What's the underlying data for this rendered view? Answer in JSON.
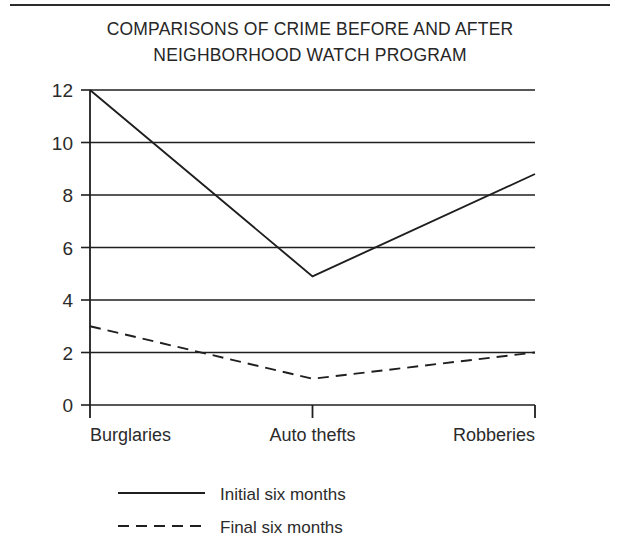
{
  "chart_data": {
    "type": "line",
    "title_line1": "COMPARISONS OF CRIME BEFORE AND AFTER",
    "title_line2": "NEIGHBORHOOD WATCH PROGRAM",
    "xlabel": "",
    "ylabel": "",
    "categories": [
      "Burglaries",
      "Auto thefts",
      "Robberies"
    ],
    "series": [
      {
        "name": "Initial six months",
        "style": "solid",
        "values": [
          12,
          4.9,
          8.8
        ]
      },
      {
        "name": "Final six months",
        "style": "dashed",
        "values": [
          3,
          1,
          2
        ]
      }
    ],
    "ylim": [
      0,
      12
    ],
    "yticks": [
      0,
      2,
      4,
      6,
      8,
      10,
      12
    ],
    "ytick_labels": [
      "0",
      "2",
      "4",
      "6",
      "8",
      "10",
      "12"
    ],
    "grid": true,
    "grid_axis": "y",
    "legend_position": "below",
    "line_color": "#1f1f1f",
    "grid_color": "#1f1f1f",
    "background": "#ffffff"
  },
  "legend": {
    "items": [
      {
        "label": "Initial six months",
        "style": "solid"
      },
      {
        "label": "Final six months",
        "style": "dashed"
      }
    ]
  }
}
